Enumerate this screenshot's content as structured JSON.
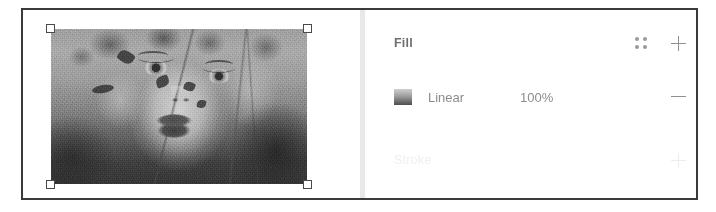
{
  "window": {
    "panes": [
      "canvas",
      "properties"
    ]
  },
  "canvas": {
    "selection": {
      "element_name": "portrait-image",
      "handles": [
        "top-left",
        "top-right",
        "bottom-left",
        "bottom-right"
      ]
    }
  },
  "properties_panel": {
    "fill_section": {
      "title": "Fill",
      "dots_icon": "dots-grid-icon",
      "add_icon": "plus-icon",
      "rows": [
        {
          "swatch": "linear-gradient-swatch",
          "type_label": "Linear",
          "opacity": "100%",
          "remove_icon": "minus-icon"
        }
      ]
    },
    "stroke_section": {
      "title": "Stroke",
      "add_icon": "plus-icon",
      "disabled": true
    }
  },
  "tooltip": {
    "label": "Style",
    "background": "#3b3b3b",
    "text_color": "#ffffff"
  },
  "cursor": {
    "icon": "mouse-pointer-icon"
  },
  "colors": {
    "frame_border": "#3a3a3a",
    "divider": "#e8e8e8",
    "section_title": "#6e6e6e",
    "muted_text": "#efefef",
    "row_text": "#8c8c8c",
    "icon": "#8f8f8f"
  }
}
